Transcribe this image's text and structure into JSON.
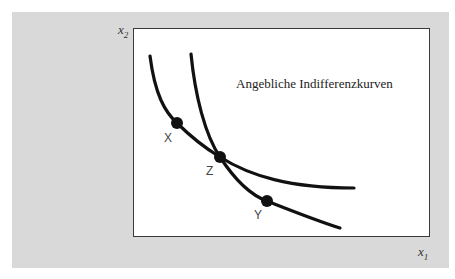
{
  "figure": {
    "title": "Angebliche Indifferenzkurven",
    "x_axis_label": "x",
    "x_axis_sub": "1",
    "y_axis_label": "x",
    "y_axis_sub": "2",
    "points": [
      {
        "label": "X",
        "x": 177,
        "y": 123
      },
      {
        "label": "Z",
        "x": 220,
        "y": 157
      },
      {
        "label": "Y",
        "x": 267,
        "y": 201
      }
    ],
    "curves": [
      {
        "name": "curve-1",
        "description": "passes through X and Z, flattening to the right"
      },
      {
        "name": "curve-2",
        "description": "steeper, passes through Z and Y"
      }
    ],
    "colors": {
      "panel": "#d9d9d9",
      "plot": "#ffffff",
      "ink": "#111111"
    }
  }
}
